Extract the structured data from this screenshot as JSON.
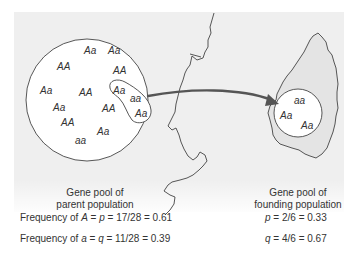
{
  "parent_pool": {
    "genotypes": [
      {
        "label": "Aa",
        "x": 84,
        "y": 46
      },
      {
        "label": "Aa",
        "x": 108,
        "y": 46
      },
      {
        "label": "AA",
        "x": 57,
        "y": 62
      },
      {
        "label": "AA",
        "x": 113,
        "y": 66
      },
      {
        "label": "Aa",
        "x": 40,
        "y": 86
      },
      {
        "label": "AA",
        "x": 79,
        "y": 88
      },
      {
        "label": "Aa",
        "x": 53,
        "y": 103
      },
      {
        "label": "AA",
        "x": 102,
        "y": 104
      },
      {
        "label": "AA",
        "x": 61,
        "y": 118
      },
      {
        "label": "Aa",
        "x": 97,
        "y": 127
      },
      {
        "label": "aa",
        "x": 75,
        "y": 136
      }
    ],
    "sample": [
      {
        "label": "Aa",
        "x": 113,
        "y": 86
      },
      {
        "label": "aa",
        "x": 130,
        "y": 94
      },
      {
        "label": "Aa",
        "x": 135,
        "y": 109
      }
    ],
    "caption_line1": "Gene pool of",
    "caption_line2": "parent population",
    "freq_A": {
      "prefix": "Frequency of ",
      "allele": "A",
      "eq1": " = ",
      "sym": "p",
      "eq2": " = 17/28 = 0.61"
    },
    "freq_a": {
      "prefix": "Frequency of ",
      "allele": "a",
      "eq1": " = ",
      "sym": "q",
      "eq2": " = 11/28 = 0.39"
    }
  },
  "founding_pool": {
    "genotypes": [
      {
        "label": "aa",
        "x": 294,
        "y": 96
      },
      {
        "label": "Aa",
        "x": 280,
        "y": 111
      },
      {
        "label": "Aa",
        "x": 301,
        "y": 121
      }
    ],
    "caption_line1": "Gene pool of",
    "caption_line2": "founding population",
    "p": {
      "sym": "p",
      "rest": " = 2/6 = 0.33"
    },
    "q": {
      "sym": "q",
      "rest": " = 4/6 = 0.67"
    }
  },
  "colors": {
    "line": "#444444",
    "arrow": "#555555",
    "background": "#efefef"
  }
}
